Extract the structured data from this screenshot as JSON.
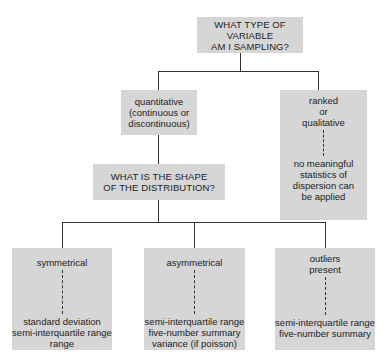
{
  "root": {
    "text": "WHAT TYPE OF VARIABLE\nAM I SAMPLING?"
  },
  "branches": {
    "quantitative": {
      "text": "quantitative\n(continuous or\ndiscontinuous)"
    },
    "ranked": {
      "label": "ranked\nor\nqualitative",
      "result": "no meaningful\nstatistics of\ndispersion can\nbe applied"
    }
  },
  "shape_question": {
    "text": "WHAT IS THE SHAPE\nOF THE DISTRIBUTION?"
  },
  "shapes": [
    {
      "label": "symmetrical",
      "result": "standard deviation\nsemi-interquartile range\nrange"
    },
    {
      "label": "asymmetrical",
      "result": "semi-interquartile range\nfive-number summary\nvariance (if poisson)"
    },
    {
      "label": "outliers\npresent",
      "result": "semi-interquartile range\nfive-number summary"
    }
  ],
  "colors": {
    "box_fill": "#d6d6d6",
    "line": "#333333",
    "background": "#ffffff"
  }
}
